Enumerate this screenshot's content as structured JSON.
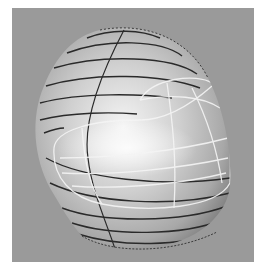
{
  "image": {
    "subject": "3D wireframe-shaded helmet surface model",
    "colors": {
      "page_background": "#ffffff",
      "viewport_background": "#9a9a9a",
      "shell_light": "#f2f2f2",
      "shell_mid": "#c4c4c4",
      "shell_dark": "#7a7a7a",
      "contour_lines": "#2a2a2a",
      "visor_lines": "#f4f4f4"
    }
  }
}
